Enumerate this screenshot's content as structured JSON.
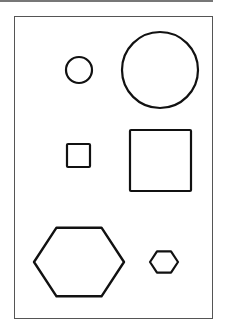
{
  "figure": {
    "stroke_color": "#111111",
    "frame_color": "#555555",
    "rows": [
      {
        "shape": "circle",
        "small": {
          "cx": 79,
          "cy": 70,
          "r": 13
        },
        "large": {
          "cx": 160,
          "cy": 70,
          "r": 38
        }
      },
      {
        "shape": "square",
        "small": {
          "x": 67,
          "y": 144,
          "size": 23
        },
        "large": {
          "x": 130,
          "y": 130,
          "size": 61
        }
      },
      {
        "shape": "hexagon",
        "large": {
          "cx": 79,
          "cy": 262,
          "r": 45
        },
        "small": {
          "cx": 164,
          "cy": 262,
          "r": 14
        }
      }
    ]
  }
}
